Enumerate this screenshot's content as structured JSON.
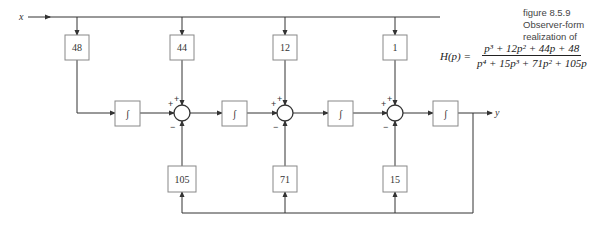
{
  "caption": {
    "figure_number": "figure 8.5.9",
    "title": "Observer-form realization of"
  },
  "formula": {
    "lhs": "H(p) =",
    "numerator": "p³ + 12p² + 44p + 48",
    "denominator": "p⁴ + 15p³ + 71p² + 105p"
  },
  "signals": {
    "input": "x",
    "output": "y"
  },
  "forward_gains": [
    "48",
    "44",
    "12",
    "1"
  ],
  "feedback_gains": [
    "105",
    "71",
    "15"
  ],
  "integrator_symbol": "∫",
  "sum_signs": {
    "plus": "+",
    "minus": "−"
  },
  "colors": {
    "line": "#333333",
    "box_border": "#888888",
    "background": "#ffffff"
  }
}
